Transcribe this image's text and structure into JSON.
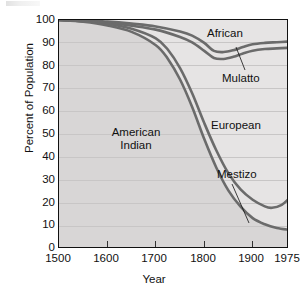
{
  "chart_data": {
    "type": "area",
    "title": "",
    "xlabel": "Year",
    "ylabel": "Percent of Population",
    "xlim": [
      1500,
      1975
    ],
    "ylim": [
      0,
      100
    ],
    "grid": true,
    "legend_position": "in-plot annotations",
    "xticks": [
      "1500",
      "1600",
      "1700",
      "1800",
      "1900",
      "1975"
    ],
    "xtick_values": [
      1500,
      1600,
      1700,
      1800,
      1900,
      1975
    ],
    "yticks": [
      "0",
      "10",
      "20",
      "30",
      "40",
      "50",
      "60",
      "70",
      "80",
      "90",
      "100"
    ],
    "ytick_values": [
      0,
      10,
      20,
      30,
      40,
      50,
      60,
      70,
      80,
      90,
      100
    ],
    "annotations": [
      {
        "label": "American Indian",
        "line1": "American",
        "line2": "Indian",
        "x": 1700,
        "y": 52
      },
      {
        "label": "African",
        "x": 1875,
        "y": 95
      },
      {
        "label": "Mulatto",
        "x": 1905,
        "y": 79,
        "leader": true
      },
      {
        "label": "European",
        "x": 1895,
        "y": 57
      },
      {
        "label": "Mestizo",
        "x": 1900,
        "y": 37,
        "leader": true
      }
    ],
    "series": [
      {
        "name": "African",
        "description": "Upper boundary curve: cumulative top band",
        "x": [
          1500,
          1550,
          1600,
          1650,
          1700,
          1750,
          1775,
          1800,
          1820,
          1840,
          1860,
          1880,
          1900,
          1925,
          1950,
          1975
        ],
        "values": [
          100,
          99.8,
          99.3,
          98.4,
          97.2,
          95.0,
          93.2,
          90.0,
          86.5,
          86.0,
          86.8,
          88.2,
          89.4,
          90.0,
          90.3,
          90.6
        ]
      },
      {
        "name": "Mulatto",
        "description": "Second boundary curve",
        "x": [
          1500,
          1550,
          1600,
          1650,
          1700,
          1750,
          1775,
          1800,
          1820,
          1840,
          1860,
          1880,
          1900,
          1925,
          1950,
          1975
        ],
        "values": [
          100,
          99.6,
          98.8,
          97.5,
          95.8,
          92.6,
          90.2,
          86.5,
          83.4,
          83.0,
          83.9,
          85.4,
          86.6,
          87.3,
          87.6,
          87.9
        ]
      },
      {
        "name": "European",
        "description": "Third boundary curve, steep decline after 1700",
        "x": [
          1500,
          1550,
          1600,
          1650,
          1700,
          1725,
          1750,
          1775,
          1800,
          1825,
          1850,
          1875,
          1900,
          1925,
          1940,
          1960,
          1975
        ],
        "values": [
          100,
          99.5,
          98.4,
          96.2,
          92.0,
          87.0,
          79.0,
          68.0,
          55.0,
          43.0,
          33.0,
          26.0,
          21.5,
          18.6,
          18.0,
          19.3,
          22.0
        ]
      },
      {
        "name": "Mestizo",
        "description": "Lowest boundary curve",
        "x": [
          1500,
          1550,
          1600,
          1650,
          1700,
          1725,
          1750,
          1775,
          1800,
          1825,
          1850,
          1875,
          1900,
          1925,
          1950,
          1975
        ],
        "values": [
          100,
          99.2,
          97.6,
          94.8,
          89.0,
          83.0,
          74.0,
          62.0,
          48.0,
          35.5,
          25.5,
          18.5,
          13.5,
          10.8,
          9.2,
          8.4
        ]
      }
    ],
    "colors": {
      "curve": "#6b6b6b",
      "band_upper": "#e6e4e4",
      "band_lower": "#d8d6d6",
      "gridline": "#c8c6c6",
      "axis": "#111111",
      "plot_background": "#eceaea",
      "page_background": "#ffffff"
    }
  }
}
